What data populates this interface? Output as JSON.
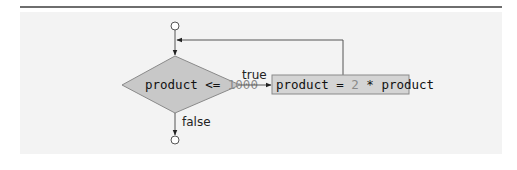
{
  "diagram": {
    "type": "uml-activity-flowchart",
    "decision": {
      "variable": "product",
      "operator": "<=",
      "value": "1000"
    },
    "action": {
      "lhs": "product",
      "assign": "=",
      "factor": "2",
      "times": "*",
      "rhs": "product"
    },
    "edges": {
      "true_label": "true",
      "false_label": "false"
    },
    "colors": {
      "decision_fill": "#c8c8c8",
      "action_fill": "#d4d4d4",
      "line": "#555555",
      "literal": "#8a8a8a",
      "panel": "#f3f3f3"
    }
  }
}
